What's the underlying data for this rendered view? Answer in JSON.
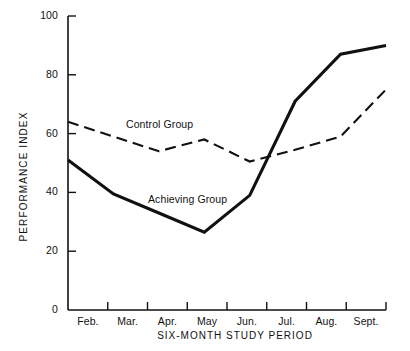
{
  "chart_data": {
    "type": "line",
    "title": "",
    "xlabel": "SIX-MONTH STUDY PERIOD",
    "ylabel": "PERFORMANCE INDEX",
    "categories": [
      "Feb.",
      "Mar.",
      "Apr.",
      "May",
      "Jun.",
      "Jul.",
      "Aug.",
      "Sept."
    ],
    "ylim": [
      0,
      100
    ],
    "yticks": [
      0,
      20,
      40,
      60,
      80,
      100
    ],
    "ytick_labels": [
      "0",
      "20",
      "40",
      "60",
      "80",
      "100"
    ],
    "grid": false,
    "legend_position": "inline-annotation",
    "series": [
      {
        "name": "Control Group",
        "style": "dashed",
        "color": "#111111",
        "values": [
          64,
          59,
          54,
          58,
          50.5,
          54.5,
          59,
          75
        ]
      },
      {
        "name": "Achieving Group",
        "style": "solid",
        "color": "#111111",
        "values": [
          51,
          39.5,
          33,
          26.5,
          39,
          71,
          87,
          90
        ]
      }
    ],
    "annotations": [
      {
        "text": "Control Group",
        "series": "Control Group"
      },
      {
        "text": "Achieving Group",
        "series": "Achieving Group"
      }
    ]
  },
  "axes": {
    "y_tick_labels": [
      "100",
      "80",
      "60",
      "40",
      "20",
      "0"
    ],
    "x_tick_labels": [
      "Feb.",
      "Mar.",
      "Apr.",
      "May",
      "Jun.",
      "Jul.",
      "Aug.",
      "Sept."
    ]
  }
}
